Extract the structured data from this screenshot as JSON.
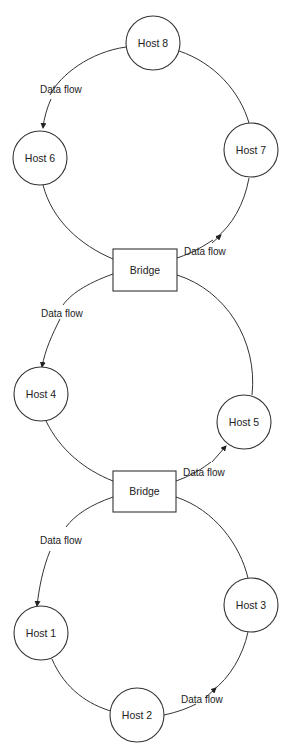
{
  "diagram": {
    "title": "",
    "stroke_color": "#333333",
    "background": "#ffffff",
    "hosts": [
      {
        "id": "host8",
        "label": "Host 8",
        "cx": 153,
        "cy": 43,
        "r": 27
      },
      {
        "id": "host6",
        "label": "Host 6",
        "cx": 40,
        "cy": 158,
        "r": 27
      },
      {
        "id": "host7",
        "label": "Host 7",
        "cx": 251,
        "cy": 150,
        "r": 27
      },
      {
        "id": "host4",
        "label": "Host 4",
        "cx": 41,
        "cy": 394,
        "r": 27
      },
      {
        "id": "host5",
        "label": "Host 5",
        "cx": 244,
        "cy": 422,
        "r": 27
      },
      {
        "id": "host1",
        "label": "Host 1",
        "cx": 41,
        "cy": 633,
        "r": 27
      },
      {
        "id": "host3",
        "label": "Host 3",
        "cx": 251,
        "cy": 605,
        "r": 27
      },
      {
        "id": "host2",
        "label": "Host 2",
        "cx": 137,
        "cy": 715,
        "r": 27
      }
    ],
    "bridges": [
      {
        "id": "bridge1",
        "label": "Bridge",
        "x": 113,
        "y": 249,
        "w": 64,
        "h": 42
      },
      {
        "id": "bridge2",
        "label": "Bridge",
        "x": 113,
        "y": 471,
        "w": 63,
        "h": 41
      }
    ],
    "rings": [
      {
        "name": "top-ring",
        "members": [
          "Host 8",
          "Host 7",
          "Bridge",
          "Host 6"
        ]
      },
      {
        "name": "middle-ring",
        "members": [
          "Bridge",
          "Host 5",
          "Bridge",
          "Host 4"
        ]
      },
      {
        "name": "bottom-ring",
        "members": [
          "Bridge",
          "Host 3",
          "Host 2",
          "Host 1"
        ]
      }
    ],
    "flow_labels": [
      {
        "text": "Data flow",
        "x": 17,
        "y": 93
      },
      {
        "text": "Data flow",
        "x": 184,
        "y": 255
      },
      {
        "text": "Data flow",
        "x": 40,
        "y": 317
      },
      {
        "text": "Data flow",
        "x": 183,
        "y": 476
      },
      {
        "text": "Data flow",
        "x": 40,
        "y": 544
      },
      {
        "text": "Data flow",
        "x": 181,
        "y": 703
      }
    ]
  }
}
